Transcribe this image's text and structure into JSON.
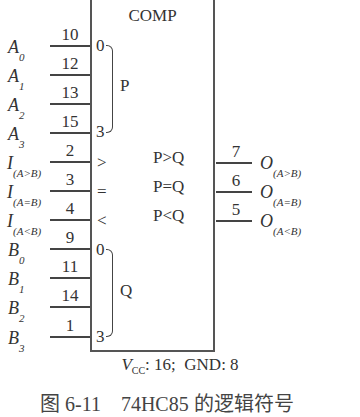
{
  "block": {
    "title": "COMP",
    "group_p_label": "P",
    "group_q_label": "Q",
    "p_bit_start": "0",
    "p_bit_end": "3",
    "q_bit_start": "0",
    "q_bit_end": "3",
    "cascade_gt": ">",
    "cascade_eq": "=",
    "cascade_lt": "<",
    "out_gt": "P>Q",
    "out_eq": "P=Q",
    "out_lt": "P<Q"
  },
  "inputs": [
    {
      "name": "A",
      "sub": "0",
      "pin": "10"
    },
    {
      "name": "A",
      "sub": "1",
      "pin": "12"
    },
    {
      "name": "A",
      "sub": "2",
      "pin": "13"
    },
    {
      "name": "A",
      "sub": "3",
      "pin": "15"
    },
    {
      "name": "I",
      "sub": "(A>B)",
      "pin": "2"
    },
    {
      "name": "I",
      "sub": "(A=B)",
      "pin": "3"
    },
    {
      "name": "I",
      "sub": "(A<B)",
      "pin": "4"
    },
    {
      "name": "B",
      "sub": "0",
      "pin": "9"
    },
    {
      "name": "B",
      "sub": "1",
      "pin": "11"
    },
    {
      "name": "B",
      "sub": "2",
      "pin": "14"
    },
    {
      "name": "B",
      "sub": "3",
      "pin": "1"
    }
  ],
  "outputs": [
    {
      "name": "O",
      "sub": "(A>B)",
      "pin": "7"
    },
    {
      "name": "O",
      "sub": "(A=B)",
      "pin": "6"
    },
    {
      "name": "O",
      "sub": "(A<B)",
      "pin": "5"
    }
  ],
  "power": {
    "vcc_label": "V",
    "vcc_sub": "CC",
    "vcc_text": ": 16;",
    "gnd_text": "GND: 8"
  },
  "caption": "图 6-11　74HC85 的逻辑符号"
}
